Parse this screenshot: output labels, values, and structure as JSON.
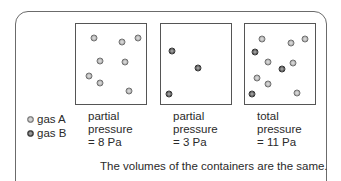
{
  "legend": [
    {
      "label": "gas A",
      "gas": "A"
    },
    {
      "label": "gas B",
      "gas": "B"
    }
  ],
  "containers": [
    {
      "label": [
        "partial",
        "pressure",
        "= 8 Pa"
      ],
      "particles": [
        {
          "gas": "A",
          "x": 0.25,
          "y": 0.18
        },
        {
          "gas": "A",
          "x": 0.66,
          "y": 0.23
        },
        {
          "gas": "A",
          "x": 0.88,
          "y": 0.18
        },
        {
          "gas": "A",
          "x": 0.34,
          "y": 0.46
        },
        {
          "gas": "A",
          "x": 0.7,
          "y": 0.48
        },
        {
          "gas": "A",
          "x": 0.18,
          "y": 0.65
        },
        {
          "gas": "A",
          "x": 0.34,
          "y": 0.74
        },
        {
          "gas": "A",
          "x": 0.76,
          "y": 0.84
        }
      ]
    },
    {
      "label": [
        "partial",
        "pressure",
        "= 3 Pa"
      ],
      "particles": [
        {
          "gas": "B",
          "x": 0.15,
          "y": 0.34
        },
        {
          "gas": "B",
          "x": 0.53,
          "y": 0.55
        },
        {
          "gas": "B",
          "x": 0.12,
          "y": 0.87
        }
      ]
    },
    {
      "label": [
        "total",
        "pressure",
        "= 11 Pa"
      ],
      "particles": [
        {
          "gas": "A",
          "x": 0.24,
          "y": 0.19
        },
        {
          "gas": "A",
          "x": 0.65,
          "y": 0.24
        },
        {
          "gas": "A",
          "x": 0.86,
          "y": 0.19
        },
        {
          "gas": "A",
          "x": 0.33,
          "y": 0.47
        },
        {
          "gas": "A",
          "x": 0.69,
          "y": 0.49
        },
        {
          "gas": "A",
          "x": 0.17,
          "y": 0.67
        },
        {
          "gas": "A",
          "x": 0.33,
          "y": 0.75
        },
        {
          "gas": "A",
          "x": 0.74,
          "y": 0.86
        },
        {
          "gas": "B",
          "x": 0.14,
          "y": 0.35
        },
        {
          "gas": "B",
          "x": 0.53,
          "y": 0.56
        },
        {
          "gas": "B",
          "x": 0.1,
          "y": 0.88
        }
      ]
    }
  ],
  "caption": "The volumes of the containers are the same."
}
